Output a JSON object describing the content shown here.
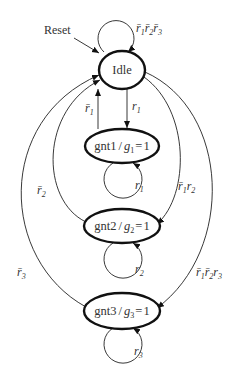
{
  "diagram": {
    "type": "state-machine",
    "reset_label": "Reset",
    "states": [
      {
        "id": "idle",
        "name": "Idle",
        "label": "Idle"
      },
      {
        "id": "gnt1",
        "name": "gnt1",
        "output_var": "g",
        "output_sub": "1",
        "output_val": "1",
        "label": "gnt1/g1=1"
      },
      {
        "id": "gnt2",
        "name": "gnt2",
        "output_var": "g",
        "output_sub": "2",
        "output_val": "1",
        "label": "gnt2/g2=1"
      },
      {
        "id": "gnt3",
        "name": "gnt3",
        "output_var": "g",
        "output_sub": "3",
        "output_val": "1",
        "label": "gnt3/g3=1"
      }
    ],
    "transitions": [
      {
        "from": "idle",
        "to": "idle",
        "condition": "r̄1 r̄2 r̄3"
      },
      {
        "from": "idle",
        "to": "gnt1",
        "condition": "r1"
      },
      {
        "from": "gnt1",
        "to": "idle",
        "condition": "r̄1"
      },
      {
        "from": "gnt1",
        "to": "gnt1",
        "condition": "r1"
      },
      {
        "from": "idle",
        "to": "gnt2",
        "condition": "r̄1 r2"
      },
      {
        "from": "gnt2",
        "to": "idle",
        "condition": "r̄2"
      },
      {
        "from": "gnt2",
        "to": "gnt2",
        "condition": "r2"
      },
      {
        "from": "idle",
        "to": "gnt3",
        "condition": "r̄1 r̄2 r3"
      },
      {
        "from": "gnt3",
        "to": "idle",
        "condition": "r̄3"
      },
      {
        "from": "gnt3",
        "to": "gnt3",
        "condition": "r3"
      }
    ],
    "text": {
      "sep": "/",
      "eq": "=",
      "r": "r",
      "g": "g",
      "one": "1",
      "two": "2",
      "three": "3",
      "bar": "‾"
    }
  }
}
